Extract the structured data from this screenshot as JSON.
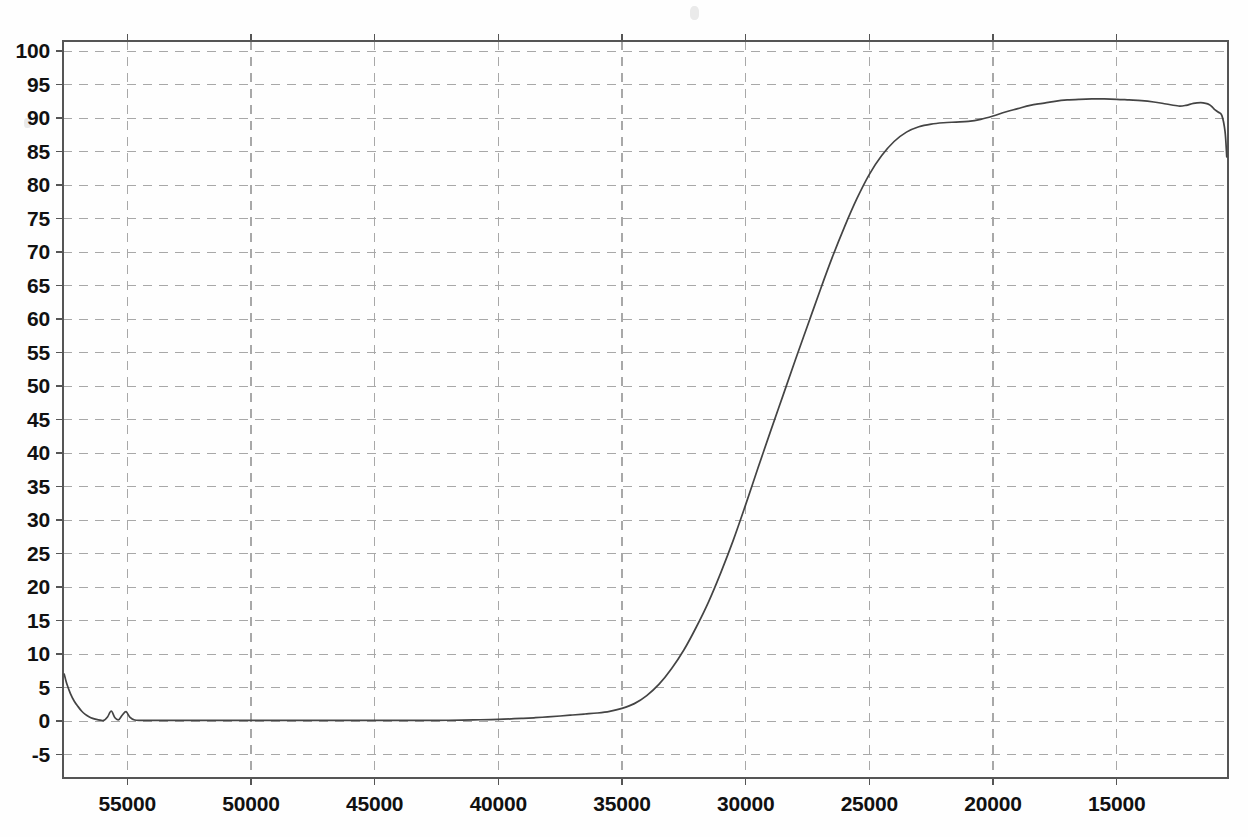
{
  "chart_data": {
    "type": "line",
    "title": "",
    "subtitle": "",
    "xlabel": "",
    "ylabel": "",
    "xlim": [
      57600,
      10500
    ],
    "ylim": [
      -8.5,
      101.5
    ],
    "x_axis_reversed": true,
    "grid": true,
    "legend": "none",
    "xticks": [
      55000,
      50000,
      45000,
      40000,
      35000,
      30000,
      25000,
      20000,
      15000
    ],
    "xtick_labels": [
      "55000",
      "50000",
      "45000",
      "40000",
      "35000",
      "30000",
      "25000",
      "20000",
      "15000"
    ],
    "yticks": [
      -5,
      0,
      5,
      10,
      15,
      20,
      25,
      30,
      35,
      40,
      45,
      50,
      55,
      60,
      65,
      70,
      75,
      80,
      85,
      90,
      95,
      100
    ],
    "ytick_labels": [
      "-5",
      "0",
      "5",
      "10",
      "15",
      "20",
      "25",
      "30",
      "35",
      "40",
      "45",
      "50",
      "55",
      "60",
      "65",
      "70",
      "75",
      "80",
      "85",
      "90",
      "95",
      "100"
    ],
    "series": [
      {
        "name": "transmittance",
        "color": "#444444",
        "x": [
          57550,
          57450,
          57300,
          57150,
          57000,
          56850,
          56700,
          56550,
          56400,
          56250,
          56100,
          55950,
          55800,
          55650,
          55500,
          55350,
          55200,
          55050,
          54900,
          54700,
          54400,
          54000,
          53500,
          53000,
          52000,
          51000,
          50000,
          49000,
          48000,
          47000,
          46000,
          45000,
          44000,
          43000,
          42000,
          41000,
          40000,
          39000,
          38500,
          38000,
          37500,
          37000,
          36500,
          36000,
          35500,
          35000,
          34500,
          34000,
          33500,
          33000,
          32500,
          32000,
          31500,
          31000,
          30500,
          30000,
          29500,
          29000,
          28500,
          28000,
          27500,
          27000,
          26500,
          26000,
          25500,
          25000,
          24500,
          24000,
          23500,
          23000,
          22500,
          22000,
          21500,
          21000,
          20500,
          20000,
          19500,
          19000,
          18500,
          18000,
          17500,
          17000,
          16500,
          16000,
          15500,
          15000,
          14500,
          14000,
          13500,
          13000,
          12500,
          12200,
          11900,
          11600,
          11400,
          11250,
          11150,
          11050,
          10900,
          10750,
          10620,
          10550
        ],
        "y": [
          7.0,
          5.6,
          4.1,
          3.0,
          2.2,
          1.5,
          1.0,
          0.65,
          0.4,
          0.25,
          0.15,
          0.1,
          0.6,
          1.5,
          0.5,
          0.2,
          0.9,
          1.4,
          0.6,
          0.15,
          0.1,
          0.1,
          0.1,
          0.1,
          0.1,
          0.1,
          0.1,
          0.1,
          0.1,
          0.1,
          0.1,
          0.1,
          0.1,
          0.1,
          0.12,
          0.18,
          0.25,
          0.4,
          0.5,
          0.62,
          0.75,
          0.9,
          1.05,
          1.2,
          1.45,
          1.9,
          2.6,
          3.8,
          5.5,
          7.8,
          10.6,
          14.0,
          17.8,
          22.2,
          27.0,
          32.3,
          37.8,
          43.2,
          48.5,
          53.8,
          59.0,
          64.2,
          69.2,
          73.8,
          78.0,
          81.6,
          84.4,
          86.5,
          87.9,
          88.7,
          89.1,
          89.3,
          89.4,
          89.5,
          89.8,
          90.3,
          90.9,
          91.4,
          91.9,
          92.2,
          92.5,
          92.7,
          92.8,
          92.85,
          92.85,
          92.8,
          92.7,
          92.6,
          92.4,
          92.1,
          91.8,
          91.9,
          92.2,
          92.3,
          92.2,
          92.0,
          91.7,
          91.3,
          90.9,
          90.4,
          88.0,
          84.2
        ]
      }
    ],
    "annotations": [
      {
        "label": "initial-spike",
        "x": 57550,
        "y": 7.0
      },
      {
        "label": "baseline-bump-1",
        "x": 55650,
        "y": 1.5
      },
      {
        "label": "baseline-bump-2",
        "x": 55050,
        "y": 1.4
      },
      {
        "label": "absorption-edge-midpoint",
        "x": 30000,
        "y": 32.3
      },
      {
        "label": "plateau-shoulder",
        "x": 23000,
        "y": 88.7
      },
      {
        "label": "plateau-maximum",
        "x": 15500,
        "y": 92.85
      },
      {
        "label": "plateau-notch",
        "x": 12500,
        "y": 91.8
      },
      {
        "label": "right-edge-dropoff",
        "x": 10550,
        "y": 84.2
      }
    ]
  },
  "axes": {
    "x_tick_labels": [
      "55000",
      "50000",
      "45000",
      "40000",
      "35000",
      "30000",
      "25000",
      "20000",
      "15000"
    ],
    "y_tick_labels": [
      "100",
      "95",
      "90",
      "85",
      "80",
      "75",
      "70",
      "65",
      "60",
      "55",
      "50",
      "45",
      "40",
      "35",
      "30",
      "25",
      "20",
      "15",
      "10",
      "5",
      "0",
      "-5"
    ]
  },
  "style": {
    "curve_color": "#444444",
    "grid_color": "#a8a8a8",
    "frame_color": "#555555",
    "text_color": "#111111",
    "background": "#fefefe"
  }
}
